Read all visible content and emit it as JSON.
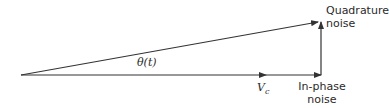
{
  "diagram": {
    "type": "phasor-diagram",
    "labels": {
      "angle": "θ(t)",
      "carrier_symbol": "V",
      "carrier_subscript": "c",
      "inphase_line1": "In-phase",
      "inphase_line2": "noise",
      "quadrature_line1": "Quadrature",
      "quadrature_line2": "noise"
    },
    "vectors": [
      {
        "name": "carrier",
        "from": [
          21,
          75
        ],
        "to": [
          266,
          75
        ]
      },
      {
        "name": "in-phase-noise",
        "from": [
          266,
          75
        ],
        "to": [
          321,
          75
        ]
      },
      {
        "name": "quadrature-noise",
        "from": [
          321,
          75
        ],
        "to": [
          321,
          22
        ]
      },
      {
        "name": "resultant",
        "from": [
          21,
          75
        ],
        "to": [
          318,
          22
        ]
      }
    ],
    "colors": {
      "line": "#333333",
      "background": "#ffffff"
    }
  }
}
